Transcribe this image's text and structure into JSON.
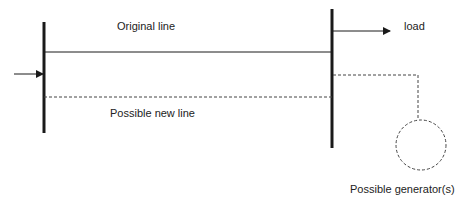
{
  "diagram": {
    "type": "power-system-one-line",
    "labels": {
      "original_line": "Original line",
      "new_line": "Possible new line",
      "load": "load",
      "generator": "Possible generator(s)"
    },
    "colors": {
      "line": "#1a1a1a",
      "dashed": "#444444",
      "text": "#222222",
      "background": "#ffffff"
    }
  }
}
